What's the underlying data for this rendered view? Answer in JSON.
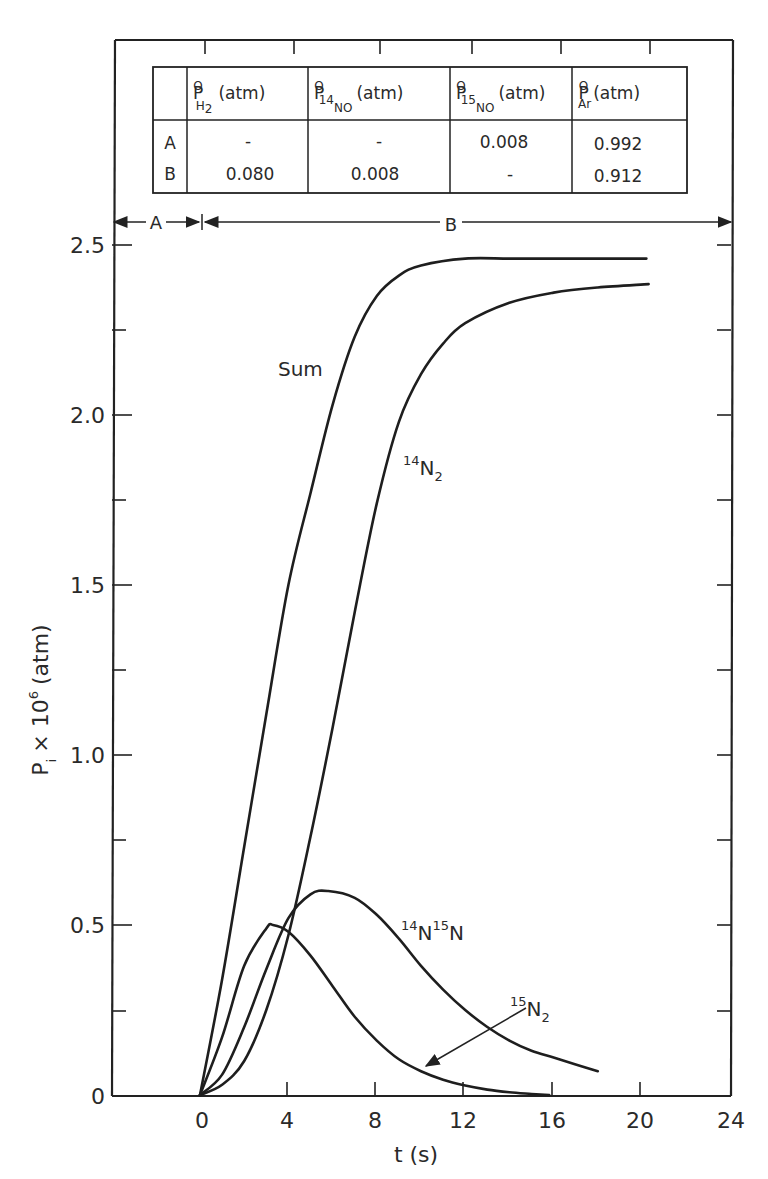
{
  "chart_data": {
    "type": "line",
    "title": "",
    "xlabel": "t (s)",
    "ylabel": "P_i × 10^6 (atm)",
    "xlim": [
      -4,
      24
    ],
    "ylim": [
      0,
      2.5
    ],
    "x_ticks": [
      0,
      4,
      8,
      12,
      16,
      20,
      24
    ],
    "x_tick_labels": [
      "0",
      "4",
      "8",
      "12",
      "16",
      "20",
      "24"
    ],
    "y_ticks": [
      0,
      0.5,
      1.0,
      1.5,
      2.0,
      2.5
    ],
    "y_tick_labels": [
      "0",
      "0.5",
      "1.0",
      "1.5",
      "2.0",
      "2.5"
    ],
    "grid": false,
    "legend": "inline curve labels",
    "series": [
      {
        "name": "Sum",
        "x": [
          0,
          1,
          2,
          3,
          4,
          5,
          6,
          7,
          8,
          9,
          10,
          12,
          14,
          16,
          18,
          20.2
        ],
        "values": [
          0,
          0.34,
          0.73,
          1.12,
          1.5,
          1.77,
          2.03,
          2.23,
          2.35,
          2.41,
          2.44,
          2.46,
          2.46,
          2.46,
          2.46,
          2.46
        ]
      },
      {
        "name": "14N2",
        "x": [
          0,
          1,
          2,
          3,
          4,
          5,
          6,
          7,
          8,
          9,
          10,
          11,
          12,
          14,
          16,
          18,
          20.3
        ],
        "values": [
          0,
          0.03,
          0.1,
          0.25,
          0.47,
          0.76,
          1.08,
          1.42,
          1.74,
          1.98,
          2.12,
          2.21,
          2.27,
          2.33,
          2.36,
          2.375,
          2.385
        ]
      },
      {
        "name": "14N15N",
        "x": [
          0,
          1,
          2,
          3,
          4,
          5,
          5.8,
          7,
          8,
          9,
          10,
          11,
          12,
          13,
          14,
          15,
          16,
          17,
          18
        ],
        "values": [
          0,
          0.06,
          0.2,
          0.37,
          0.52,
          0.59,
          0.6,
          0.58,
          0.53,
          0.46,
          0.38,
          0.31,
          0.25,
          0.2,
          0.16,
          0.13,
          0.11,
          0.09,
          0.07
        ]
      },
      {
        "name": "15N2",
        "x": [
          0,
          1,
          2,
          3,
          3.3,
          4,
          5,
          6,
          7,
          8,
          9,
          10,
          11,
          12,
          13,
          14,
          15,
          15.8
        ],
        "values": [
          0,
          0.17,
          0.38,
          0.49,
          0.5,
          0.48,
          0.41,
          0.32,
          0.23,
          0.16,
          0.105,
          0.07,
          0.045,
          0.028,
          0.016,
          0.008,
          0.003,
          0
        ]
      }
    ],
    "annotations": [
      {
        "text": "Sum",
        "x": 4.3,
        "y": 2.17
      },
      {
        "text": "14N2",
        "x": 9.2,
        "y": 1.86
      },
      {
        "text": "14N15N",
        "x": 9.1,
        "y": 0.52
      },
      {
        "text": "15N2",
        "x": 15.5,
        "y": 0.27,
        "arrow_to": [
          10.2,
          0.1
        ]
      }
    ],
    "regions": [
      {
        "label": "A",
        "x_range": [
          -4,
          0
        ]
      },
      {
        "label": "B",
        "x_range": [
          0,
          24
        ]
      }
    ],
    "table": {
      "columns": [
        "",
        "P°H2 (atm)",
        "P°14NO (atm)",
        "P°15NO (atm)",
        "P°Ar (atm)"
      ],
      "rows": [
        [
          "A",
          "–",
          "–",
          "0.008",
          "0.992"
        ],
        [
          "B",
          "0.080",
          "0.008",
          "–",
          "0.912"
        ]
      ]
    }
  },
  "labels": {
    "x_axis": "t (s)",
    "y_axis_main": "P",
    "y_axis_sub": "i",
    "y_axis_rest": "× 10",
    "y_axis_exp": "6",
    "y_axis_unit": "(atm)",
    "region_a": "A",
    "region_b": "B",
    "sum": "Sum",
    "n14n2_sup": "14",
    "n14n2_main": "N",
    "n14n2_sub": "2",
    "n14n15n_sup1": "14",
    "n14n15n_main1": "N",
    "n14n15n_sup2": "15",
    "n14n15n_main2": "N",
    "n15n2_sup": "15",
    "n15n2_main": "N",
    "n15n2_sub": "2"
  },
  "table": {
    "header": [
      {
        "p": "P",
        "sup": "O",
        "sub": "H",
        "subsub": "2",
        "unit": "(atm)"
      },
      {
        "p": "P",
        "sup": "O",
        "sub": "NO",
        "subsup": "14",
        "unit": "(atm)"
      },
      {
        "p": "P",
        "sup": "O",
        "sub": "NO",
        "subsup": "15",
        "unit": "(atm)"
      },
      {
        "p": "P",
        "sup": "O",
        "sub": "Ar",
        "unit": "(atm)"
      }
    ],
    "rows": [
      {
        "label": "A",
        "cells": [
          "-",
          "-",
          "0.008",
          "0.992"
        ]
      },
      {
        "label": "B",
        "cells": [
          "0.080",
          "0.008",
          "-",
          "0.912"
        ]
      }
    ]
  }
}
